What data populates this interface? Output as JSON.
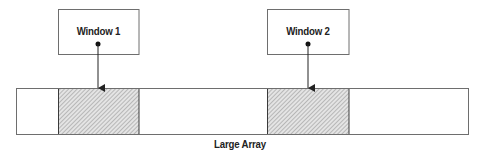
{
  "diagram": {
    "windows": [
      {
        "label": "Window 1",
        "box": {
          "x": 58,
          "y": 9,
          "w": 81,
          "h": 46
        },
        "pointer_x": 98
      },
      {
        "label": "Window 2",
        "box": {
          "x": 267,
          "y": 9,
          "w": 82,
          "h": 46
        },
        "pointer_x": 308
      }
    ],
    "array": {
      "label": "Large Array",
      "box": {
        "x": 16,
        "y": 88,
        "w": 453,
        "h": 47
      },
      "segments": [
        {
          "x0": 16,
          "x1": 58,
          "hatched": false
        },
        {
          "x0": 58,
          "x1": 139,
          "hatched": true
        },
        {
          "x0": 139,
          "x1": 267,
          "hatched": false
        },
        {
          "x0": 267,
          "x1": 349,
          "hatched": true
        },
        {
          "x0": 349,
          "x1": 469,
          "hatched": false
        }
      ]
    },
    "colors": {
      "stroke": "#6e6e6e",
      "divider": "#3a3a3a",
      "hatch_bg": "#e4e4e4",
      "hatch_line": "#8a8a8a",
      "arrow": "#222222"
    }
  }
}
